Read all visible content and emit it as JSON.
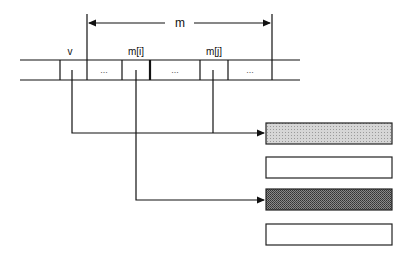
{
  "diagram": {
    "dimension_label": "m",
    "array": {
      "cells": [
        {
          "label": "v",
          "content": ""
        },
        {
          "label": "",
          "content": "..."
        },
        {
          "label": "m[i]",
          "content": ""
        },
        {
          "label": "",
          "content": "..."
        },
        {
          "label": "m[j]",
          "content": ""
        },
        {
          "label": "",
          "content": "..."
        }
      ]
    },
    "boxes": [
      {
        "fill": "#c8c8c8",
        "pattern": "light-hatch"
      },
      {
        "fill": "#ffffff",
        "pattern": "none"
      },
      {
        "fill": "#6e6e6e",
        "pattern": "dark-hatch"
      },
      {
        "fill": "#ffffff",
        "pattern": "none"
      }
    ],
    "arrows": [
      {
        "from": "v",
        "to": "box-1"
      },
      {
        "from": "m[j]",
        "to": "box-1"
      },
      {
        "from": "m[i]",
        "to": "box-3"
      }
    ]
  }
}
